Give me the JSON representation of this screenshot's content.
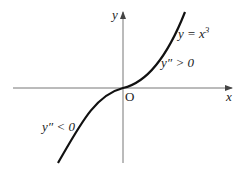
{
  "diagram": {
    "curve_label": "y = x",
    "curve_exponent": "3",
    "convex_label": "y″ > 0",
    "concave_label": "y″ < 0",
    "origin_label": "O",
    "x_axis_label": "x",
    "y_axis_label": "y",
    "colors": {
      "axis": "#555555",
      "curve": "#111111",
      "text": "#222222"
    }
  }
}
